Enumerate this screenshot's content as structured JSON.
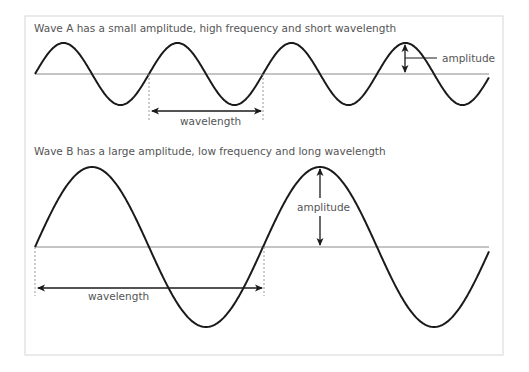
{
  "waveA": {
    "caption": "Wave A has a small amplitude, high frequency and short wavelength",
    "amplitude_label": "amplitude",
    "wavelength_label": "wavelength",
    "axis_y": 74,
    "amplitude_px": 31,
    "period_px": 114,
    "x_start": 35,
    "x_end": 489
  },
  "waveB": {
    "caption": "Wave B has a large amplitude, low frequency and long wavelength",
    "amplitude_label": "amplitude",
    "wavelength_label": "wavelength",
    "axis_y": 247,
    "amplitude_px": 80,
    "period_px": 228,
    "x_start": 35,
    "x_end": 489
  },
  "colors": {
    "wave": "#1a1a1a",
    "axis": "#8a8a8a",
    "frame": "#d6d6d6",
    "text": "#555555",
    "dashed": "#9a9a9a"
  }
}
